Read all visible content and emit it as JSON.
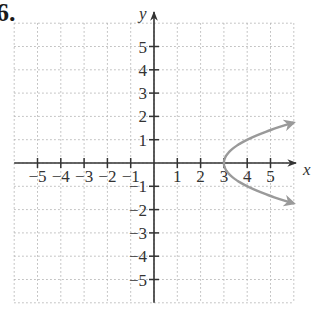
{
  "problem_number": "6.",
  "chart_data": {
    "type": "line",
    "title": "",
    "xlabel": "x",
    "ylabel": "y",
    "xlim": [
      -6,
      6
    ],
    "ylim": [
      -6,
      6
    ],
    "grid": true,
    "grid_style": "dotted",
    "x_tick_labels": [
      "-5",
      "-4",
      "-3",
      "-2",
      "-1",
      "1",
      "2",
      "3",
      "4",
      "5"
    ],
    "y_tick_labels": [
      "5",
      "4",
      "3",
      "2",
      "1",
      "-1",
      "-2",
      "-3",
      "-4",
      "-5"
    ],
    "series": [
      {
        "name": "x = y^2 + 3",
        "equation": "x = y^2 + 3",
        "vertex": [
          3,
          0
        ],
        "color": "#9a9a9a",
        "arrows": "both ends",
        "points": [
          [
            6,
            1.73
          ],
          [
            5,
            1.41
          ],
          [
            4,
            1
          ],
          [
            3.25,
            0.5
          ],
          [
            3,
            0
          ],
          [
            3.25,
            -0.5
          ],
          [
            4,
            -1
          ],
          [
            5,
            -1.41
          ],
          [
            6,
            -1.73
          ]
        ]
      }
    ]
  },
  "colors": {
    "axis": "#333333",
    "grid": "#b5b5b5",
    "curve": "#9a9a9a",
    "background": "#ffffff"
  }
}
